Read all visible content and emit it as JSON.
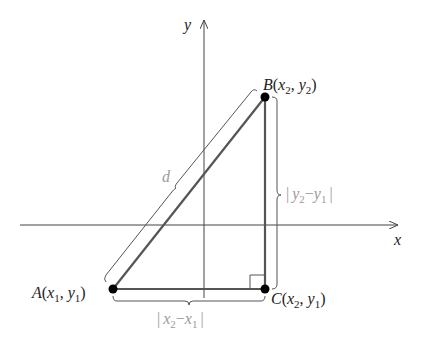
{
  "diagram": {
    "axes": {
      "x_label": "x",
      "y_label": "y"
    },
    "points": {
      "A": {
        "name": "A",
        "coords": "(x1, y1)",
        "label_main": "A",
        "label_open": "(",
        "var1": "x",
        "sub1": "1",
        "sep": ", ",
        "var2": "y",
        "sub2": "1",
        "label_close": ")"
      },
      "B": {
        "name": "B",
        "coords": "(x2, y2)",
        "label_main": "B",
        "label_open": "(",
        "var1": "x",
        "sub1": "2",
        "sep": ", ",
        "var2": "y",
        "sub2": "2",
        "label_close": ")"
      },
      "C": {
        "name": "C",
        "coords": "(x2, y1)",
        "label_main": "C",
        "label_open": "(",
        "var1": "x",
        "sub1": "2",
        "sep": ", ",
        "var2": "y",
        "sub2": "1",
        "label_close": ")"
      }
    },
    "measures": {
      "hypotenuse": "d",
      "vertical": {
        "bar": "|",
        "a": "y",
        "a_sub": "2",
        "minus": "−",
        "b": "y",
        "b_sub": "1"
      },
      "horizontal": {
        "bar": "|",
        "a": "x",
        "a_sub": "2",
        "minus": "−",
        "b": "x",
        "b_sub": "1"
      }
    },
    "colors": {
      "lines": "#333333",
      "axes": "#444444",
      "label_gray": "#9a9a9a",
      "points": "#000000"
    }
  }
}
